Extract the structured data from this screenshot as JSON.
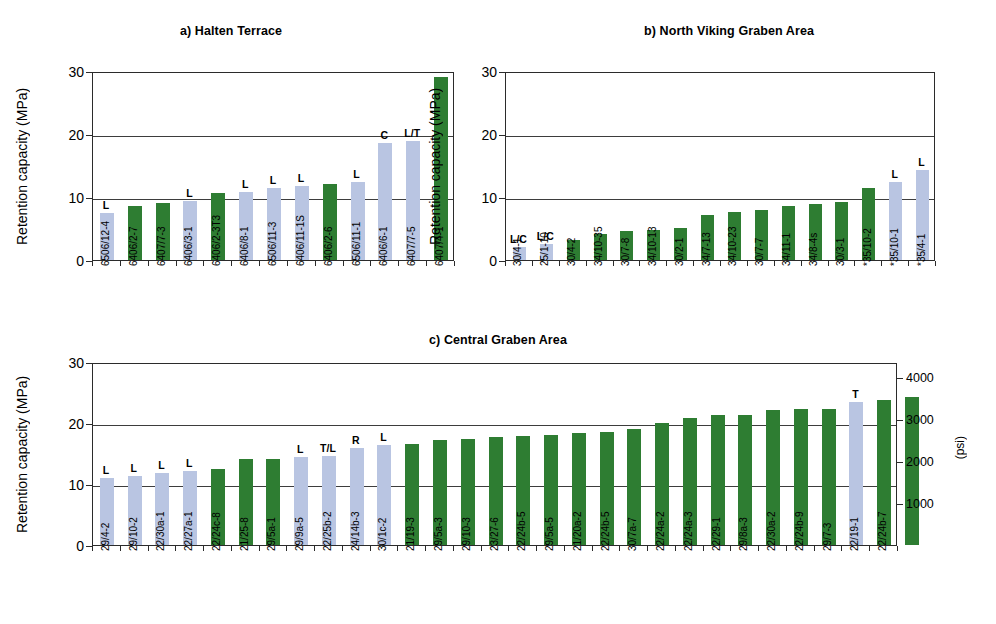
{
  "figure": {
    "axis_color": "#2b2b2b",
    "green": "#2e7d32",
    "blue": "#b9c5e2"
  },
  "chart_data": [
    {
      "type": "bar",
      "panel": "a",
      "title": "a) Halten Terrace",
      "xlabel": "",
      "ylabel": "Retention capacity (MPa)",
      "ylim": [
        0,
        30
      ],
      "yticks": [
        0,
        10,
        20,
        30
      ],
      "ytick_labels": [
        "0",
        "10",
        "20",
        "30"
      ],
      "grid": true,
      "legend": "none",
      "categories": [
        "6506/12-4",
        "6406/2-7",
        "6407/7-3",
        "6406/3-1",
        "6406/2-3T3",
        "6406/8-1",
        "6506/11-3",
        "6406/11-1S",
        "6406/2-6",
        "6506/11-1",
        "6406/6-1",
        "6407/7-5",
        "6407/4-1"
      ],
      "values": [
        7.5,
        8.6,
        9.0,
        9.4,
        10.6,
        10.8,
        11.4,
        11.7,
        12.1,
        12.4,
        18.6,
        18.9,
        29.0
      ],
      "colors": [
        "blue",
        "green",
        "green",
        "blue",
        "green",
        "blue",
        "blue",
        "blue",
        "green",
        "blue",
        "blue",
        "blue",
        "green"
      ],
      "annotations": [
        "L",
        "",
        "",
        "L",
        "",
        "L",
        "L",
        "L",
        "",
        "L",
        "C",
        "L/T",
        ""
      ]
    },
    {
      "type": "bar",
      "panel": "b",
      "title": "b) North Viking Graben Area",
      "xlabel": "",
      "ylabel": "Retention capacity (MPa)",
      "ylim": [
        0,
        30
      ],
      "yticks": [
        0,
        10,
        20,
        30
      ],
      "ytick_labels": [
        "0",
        "10",
        "20",
        "30"
      ],
      "grid": true,
      "legend": "none",
      "categories": [
        "30/4-1",
        "25/1-10",
        "30/4-2",
        "34/10-35",
        "30/7-8",
        "34/10-13",
        "30/2-1",
        "34/7-13",
        "34/10-23",
        "30/7-7",
        "34/11-1",
        "34/8-4s",
        "30/3-1",
        "*35/10-2",
        "*35/10-1",
        "*35/4-1"
      ],
      "values": [
        2.0,
        2.5,
        3.2,
        4.2,
        4.6,
        4.7,
        5.1,
        7.2,
        7.6,
        7.9,
        8.6,
        8.9,
        9.2,
        11.5,
        12.4,
        14.3
      ],
      "colors": [
        "blue",
        "blue",
        "green",
        "green",
        "green",
        "green",
        "green",
        "green",
        "green",
        "green",
        "green",
        "green",
        "green",
        "green",
        "blue",
        "blue"
      ],
      "annotations": [
        "L/C",
        "L/C",
        "",
        "",
        "",
        "",
        "",
        "",
        "",
        "",
        "",
        "",
        "",
        "",
        "L",
        "L"
      ]
    },
    {
      "type": "bar",
      "panel": "c",
      "title": "c) Central Graben Area",
      "xlabel": "",
      "ylabel": "Retention capacity (MPa)",
      "ylabel_right": "(psi)",
      "ylim": [
        0,
        30
      ],
      "yticks": [
        0,
        10,
        20,
        30
      ],
      "ytick_labels": [
        "0",
        "10",
        "20",
        "30"
      ],
      "yticks_right": [
        1000,
        2000,
        3000,
        4000
      ],
      "ytick_labels_right": [
        "1000",
        "2000",
        "3000",
        "4000"
      ],
      "grid": true,
      "legend": "none",
      "categories": [
        "29/4-2",
        "29/10-2",
        "22/30a-1",
        "22/27a-1",
        "22/24c-8",
        "21/25-8",
        "29/5a-1",
        "29/9a-5",
        "22/25b-2",
        "24/14b-3",
        "30/1c-2",
        "21/19-3",
        "29/5a-3",
        "29/10-3",
        "23/27-6",
        "22/24b-5",
        "29/5a-5",
        "21/20a-2",
        "22/24b-5",
        "30/7a-7",
        "22/24a-2",
        "22/24a-3",
        "22/29-1",
        "29/8a-3",
        "22/30a-2",
        "22/24b-9",
        "29/7-3",
        "22/19-1",
        "22/24b-7"
      ],
      "values": [
        11.0,
        11.3,
        11.8,
        12.1,
        12.5,
        14.1,
        14.1,
        14.5,
        14.6,
        15.9,
        16.4,
        16.6,
        17.2,
        17.4,
        17.7,
        17.9,
        18.0,
        18.3,
        18.5,
        19.0,
        20.0,
        20.9,
        21.3,
        21.3,
        22.1,
        22.3,
        22.3,
        23.4,
        23.7,
        24.2
      ],
      "colors": [
        "blue",
        "blue",
        "blue",
        "blue",
        "green",
        "green",
        "green",
        "blue",
        "blue",
        "blue",
        "blue",
        "green",
        "green",
        "green",
        "green",
        "green",
        "green",
        "green",
        "green",
        "green",
        "green",
        "green",
        "green",
        "green",
        "green",
        "green",
        "green",
        "blue",
        "green",
        "green"
      ],
      "annotations": [
        "L",
        "L",
        "L",
        "L",
        "",
        "",
        "",
        "L",
        "T/L",
        "R",
        "L",
        "",
        "",
        "",
        "",
        "",
        "",
        "",
        "",
        "",
        "",
        "",
        "",
        "",
        "",
        "",
        "",
        "T",
        "",
        ""
      ]
    }
  ]
}
